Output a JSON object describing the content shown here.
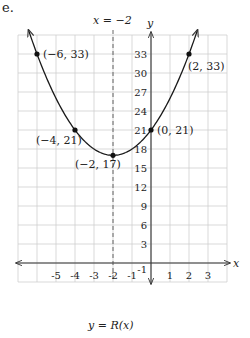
{
  "problem_label": "e.",
  "chart_data": {
    "type": "line",
    "title": "y = R(x)",
    "function_label": "y = R(x)",
    "xlabel": "x",
    "ylabel": "y",
    "xlim": [
      -7,
      4
    ],
    "ylim": [
      -3,
      36
    ],
    "grid": true,
    "x_unit": 1,
    "y_unit": 3,
    "x_tick_labels": [
      "-5",
      "-4",
      "-3",
      "-2",
      "-1",
      "1",
      "2",
      "3"
    ],
    "x_tick_values": [
      -5,
      -4,
      -3,
      -2,
      -1,
      1,
      2,
      3
    ],
    "y_tick_labels": [
      "33",
      "30",
      "27",
      "24",
      "21",
      "18",
      "15",
      "12",
      "9",
      "6",
      "3",
      "-1"
    ],
    "y_tick_values": [
      33,
      30,
      27,
      24,
      21,
      18,
      15,
      12,
      9,
      6,
      3,
      -1
    ],
    "curve": "parabola",
    "equation_implied": "R(x) = (x+2)^2 + 17",
    "axis_of_symmetry": {
      "label": "x = −2",
      "x": -2,
      "style": "dashed"
    },
    "points": [
      {
        "x": -6,
        "y": 33,
        "label": "(−6, 33)"
      },
      {
        "x": -4,
        "y": 21,
        "label": "(−4, 21)"
      },
      {
        "x": -2,
        "y": 17,
        "label": "(−2, 17)"
      },
      {
        "x": 0,
        "y": 21,
        "label": "(0, 21)"
      },
      {
        "x": 2,
        "y": 33,
        "label": "(2, 33)"
      }
    ]
  },
  "labels": {
    "axis_of_symmetry": "x = −2",
    "x_axis": "x",
    "y_axis": "y",
    "function": "y = R(x)",
    "p1": "(−6, 33)",
    "p2": "(−4, 21)",
    "p3": "(−2, 17)",
    "p4": "(0, 21)",
    "p5": "(2, 33)"
  },
  "colors": {
    "grid": "#cfcfcf",
    "axis": "#333333",
    "curve": "#1a1a1a",
    "point": "#111111",
    "dashed": "#555555"
  }
}
